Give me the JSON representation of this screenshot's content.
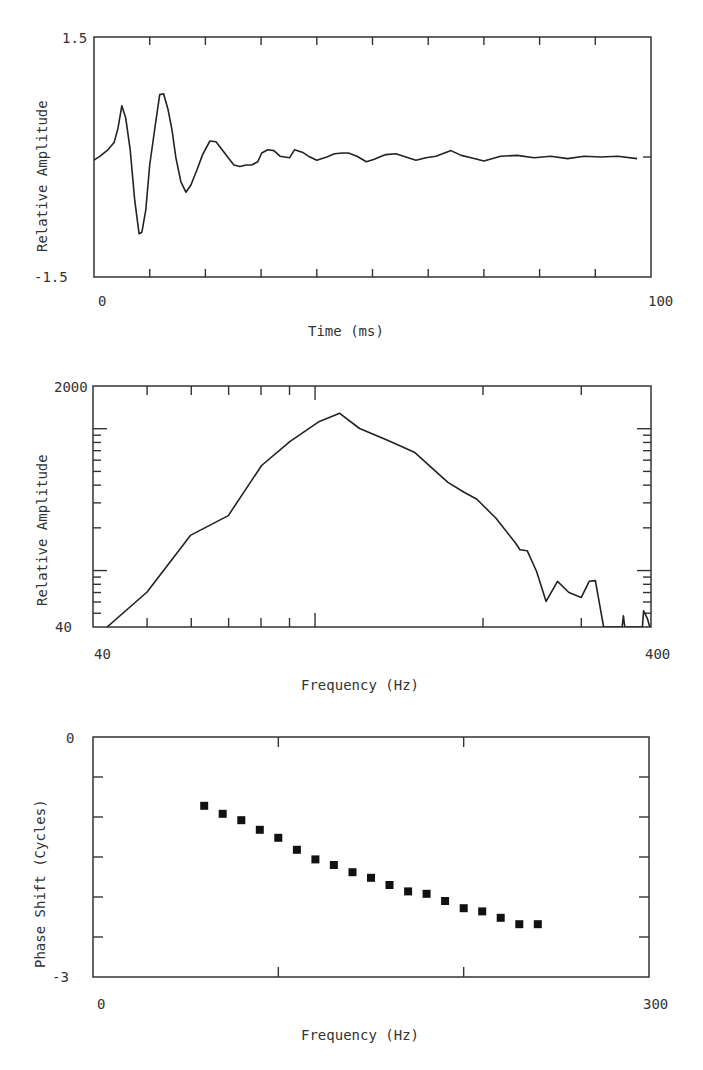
{
  "chart_data": [
    {
      "type": "line",
      "panel": "top",
      "title": "",
      "xlabel": "Time (ms)",
      "ylabel": "Relative Amplitude",
      "xlim": [
        0,
        100
      ],
      "ylim": [
        -1.5,
        1.5
      ],
      "x_tick_labels": [
        "0",
        "100"
      ],
      "y_tick_labels": [
        "1.5",
        "-1.5"
      ],
      "x_ticks": [
        0,
        10,
        20,
        30,
        40,
        50,
        60,
        70,
        80,
        90,
        100
      ],
      "y_ticks": [
        -1.5,
        0,
        1.5
      ],
      "grid": false,
      "series": [
        {
          "name": "waveform",
          "x": [
            0,
            1.1,
            2.5,
            3.6,
            4.3,
            5.0,
            5.7,
            6.5,
            7.3,
            8.1,
            8.6,
            9.3,
            10.0,
            11.0,
            11.8,
            12.5,
            13.3,
            14.0,
            14.7,
            15.6,
            16.5,
            17.4,
            18.5,
            19.5,
            20.8,
            21.9,
            23.0,
            24.0,
            25.1,
            26.2,
            27.3,
            28.3,
            29.4,
            30.1,
            31.2,
            32.3,
            33.4,
            35.1,
            36.0,
            37.4,
            38.5,
            40.0,
            41.8,
            43.2,
            44.6,
            45.7,
            47.2,
            48.9,
            50.2,
            51.6,
            52.4,
            54.2,
            56.0,
            57.8,
            59.6,
            61.4,
            64.1,
            65.9,
            67.7,
            70.0,
            73.0,
            76.0,
            79.0,
            82.0,
            85.0,
            88.0,
            91.0,
            94.0,
            97.5
          ],
          "y": [
            -0.04,
            0.01,
            0.09,
            0.18,
            0.36,
            0.64,
            0.49,
            0.09,
            -0.54,
            -0.96,
            -0.94,
            -0.66,
            -0.1,
            0.4,
            0.78,
            0.79,
            0.59,
            0.34,
            -0.01,
            -0.31,
            -0.44,
            -0.35,
            -0.16,
            0.03,
            0.2,
            0.19,
            0.09,
            0.0,
            -0.1,
            -0.12,
            -0.1,
            -0.1,
            -0.06,
            0.05,
            0.09,
            0.08,
            0.01,
            -0.01,
            0.09,
            0.06,
            0.01,
            -0.04,
            0.0,
            0.04,
            0.05,
            0.05,
            0.01,
            -0.06,
            -0.03,
            0.01,
            0.03,
            0.04,
            0.0,
            -0.04,
            -0.01,
            0.01,
            0.08,
            0.02,
            -0.01,
            -0.05,
            0.01,
            0.02,
            -0.01,
            0.01,
            -0.02,
            0.01,
            0.0,
            0.01,
            -0.02
          ]
        }
      ]
    },
    {
      "type": "line",
      "panel": "middle",
      "title": "",
      "xlabel": "Frequency (Hz)",
      "ylabel": "Relative Amplitude",
      "xscale": "log",
      "yscale": "log",
      "xlim": [
        40,
        400
      ],
      "ylim": [
        40,
        2000
      ],
      "x_tick_labels": [
        "40",
        "400"
      ],
      "y_tick_labels": [
        "2000",
        "40"
      ],
      "x_ticks": [
        50,
        60,
        70,
        80,
        90,
        100,
        200,
        300
      ],
      "y_ticks": [
        50,
        60,
        70,
        80,
        90,
        100,
        200,
        300,
        400,
        500,
        600,
        700,
        800,
        900,
        1000
      ],
      "grid": false,
      "series": [
        {
          "name": "spectrum",
          "x": [
            42.4,
            50,
            59.8,
            69.9,
            80.2,
            90.2,
            101.8,
            110.7,
            120.2,
            135.2,
            151,
            173,
            185,
            195,
            211,
            228.5,
            233,
            240,
            249.5,
            259.5,
            272,
            285,
            300,
            310,
            318,
            329,
            355,
            357,
            359,
            386,
            388,
            394,
            398
          ],
          "y": [
            40,
            70.6,
            177,
            244,
            550,
            814,
            1125,
            1283,
            1003,
            825,
            679,
            418,
            356,
            318,
            234,
            157,
            140,
            138,
            98.5,
            60.6,
            83.9,
            70,
            64.7,
            84,
            85,
            40,
            40,
            48,
            40,
            40,
            52,
            46,
            40
          ]
        }
      ]
    },
    {
      "type": "scatter",
      "panel": "bottom",
      "title": "",
      "xlabel": "Frequency (Hz)",
      "ylabel": "Phase Shift (Cycles)",
      "xlim": [
        0,
        300
      ],
      "ylim": [
        -3,
        0
      ],
      "x_tick_labels": [
        "0",
        "300"
      ],
      "y_tick_labels": [
        "0",
        "-3"
      ],
      "x_ticks": [
        100,
        200
      ],
      "y_ticks": [
        -0.5,
        -1.0,
        -1.5,
        -2.0,
        -2.5
      ],
      "grid": false,
      "series": [
        {
          "name": "phase",
          "marker": "square",
          "x": [
            60,
            70,
            80,
            90,
            100,
            110,
            120,
            130,
            140,
            150,
            160,
            170,
            180,
            190,
            200,
            210,
            220,
            230,
            240
          ],
          "y": [
            -0.86,
            -0.96,
            -1.04,
            -1.16,
            -1.26,
            -1.41,
            -1.53,
            -1.6,
            -1.69,
            -1.76,
            -1.85,
            -1.93,
            -1.96,
            -2.05,
            -2.14,
            -2.18,
            -2.26,
            -2.34,
            -2.34
          ]
        }
      ]
    }
  ],
  "panels": {
    "top": {
      "ylabel": "Relative Amplitude",
      "xlabel": "Time (ms)",
      "ymax_label": "1.5",
      "ymin_label": "-1.5",
      "xmin_label": "0",
      "xmax_label": "100"
    },
    "middle": {
      "ylabel": "Relative Amplitude",
      "xlabel": "Frequency (Hz)",
      "ymax_label": "2000",
      "ymin_label": "40",
      "xmin_label": "40",
      "xmax_label": "400"
    },
    "bottom": {
      "ylabel": "Phase Shift (Cycles)",
      "xlabel": "Frequency (Hz)",
      "ymax_label": "0",
      "ymin_label": "-3",
      "xmin_label": "0",
      "xmax_label": "300"
    }
  },
  "colors": {
    "ink": "#222222",
    "frame": "#333333",
    "background": "#ffffff"
  }
}
